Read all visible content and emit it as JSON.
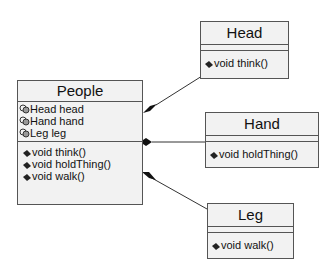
{
  "classes": {
    "people": {
      "name": "People",
      "attributes": [
        "Head head",
        "Hand hand",
        "Leg leg"
      ],
      "operations": [
        "void think()",
        "void holdThing()",
        "void walk()"
      ]
    },
    "head": {
      "name": "Head",
      "operations": [
        "void think()"
      ]
    },
    "hand": {
      "name": "Hand",
      "operations": [
        "void holdThing()"
      ]
    },
    "leg": {
      "name": "Leg",
      "operations": [
        "void walk()"
      ]
    }
  },
  "relations": [
    {
      "type": "composition",
      "from": "People",
      "to": "Head"
    },
    {
      "type": "composition",
      "from": "People",
      "to": "Hand"
    },
    {
      "type": "composition",
      "from": "People",
      "to": "Leg"
    }
  ],
  "icons": {
    "attribute": "field-icon",
    "operation": "method-icon"
  }
}
